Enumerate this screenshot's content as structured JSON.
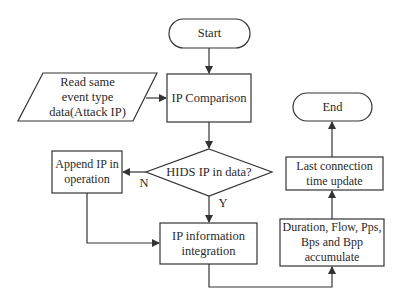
{
  "diagram": {
    "type": "flowchart",
    "nodes": {
      "start": {
        "label": "Start",
        "shape": "terminator"
      },
      "read_data": {
        "label_lines": [
          "Read same",
          "event type",
          "data(Attack IP)"
        ],
        "shape": "parallelogram"
      },
      "ip_comparison": {
        "label": "IP Comparison",
        "shape": "process"
      },
      "hids_check": {
        "label": "HIDS IP in data?",
        "shape": "decision"
      },
      "append_ip": {
        "label_lines": [
          "Append IP in",
          "operation"
        ],
        "shape": "process"
      },
      "ip_integration": {
        "label_lines": [
          "IP information",
          "integration"
        ],
        "shape": "process"
      },
      "accumulate": {
        "label_lines": [
          "Duration, Flow, Pps,",
          "Bps and Bpp",
          "accumulate"
        ],
        "shape": "process"
      },
      "last_conn": {
        "label_lines": [
          "Last connection",
          "time update"
        ],
        "shape": "process"
      },
      "end": {
        "label": "End",
        "shape": "terminator"
      }
    },
    "edge_labels": {
      "no": "N",
      "yes": "Y"
    },
    "edges": [
      {
        "from": "start",
        "to": "ip_comparison"
      },
      {
        "from": "read_data",
        "to": "ip_comparison"
      },
      {
        "from": "ip_comparison",
        "to": "hids_check"
      },
      {
        "from": "hids_check",
        "to": "append_ip",
        "label": "N"
      },
      {
        "from": "hids_check",
        "to": "ip_integration",
        "label": "Y"
      },
      {
        "from": "append_ip",
        "to": "ip_integration"
      },
      {
        "from": "ip_integration",
        "to": "accumulate"
      },
      {
        "from": "accumulate",
        "to": "last_conn"
      },
      {
        "from": "last_conn",
        "to": "end"
      }
    ],
    "colors": {
      "stroke": "#333333",
      "text": "#2a2a2a",
      "background": "#ffffff"
    }
  }
}
